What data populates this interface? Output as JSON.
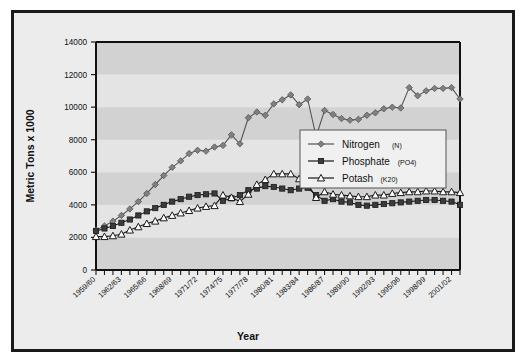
{
  "chart_data": {
    "type": "line",
    "title": "",
    "xlabel": "Year",
    "ylabel": "Metric Tons x 1000",
    "ylim": [
      0,
      14000
    ],
    "ytick_values": [
      0,
      2000,
      4000,
      6000,
      8000,
      10000,
      12000,
      14000
    ],
    "ytick_labels": [
      "0",
      "2000",
      "4000",
      "6000",
      "8000",
      "10000",
      "12000",
      "14000"
    ],
    "grid": "horizontal-bands",
    "legend_position": "inside-right-middle",
    "x": [
      "1959/60",
      "1960/61",
      "1961/62",
      "1962/63",
      "1963/64",
      "1964/65",
      "1965/66",
      "1966/67",
      "1967/68",
      "1968/69",
      "1969/70",
      "1970/71",
      "1971/72",
      "1972/73",
      "1973/74",
      "1974/75",
      "1975/76",
      "1976/77",
      "1977/78",
      "1978/79",
      "1979/80",
      "1980/81",
      "1981/82",
      "1982/83",
      "1983/84",
      "1984/85",
      "1985/86",
      "1986/87",
      "1987/88",
      "1988/89",
      "1989/90",
      "1990/91",
      "1991/92",
      "1992/93",
      "1993/94",
      "1994/95",
      "1995/96",
      "1996/97",
      "1997/98",
      "1998/99",
      "1999/00",
      "2000/01",
      "2001/02",
      "2002/03"
    ],
    "xtick_labels": [
      "1959/60",
      "1962/63",
      "1965/66",
      "1968/69",
      "1971/72",
      "1974/75",
      "1977/78",
      "1980/81",
      "1983/84",
      "1986/87",
      "1989/90",
      "1992/93",
      "1995/96",
      "1998/99",
      "2001/02"
    ],
    "xtick_label_interval": 3,
    "series": [
      {
        "name": "Nitrogen",
        "subscript": "(N)",
        "marker": "diamond",
        "color": "#808080",
        "line_color": "#555555",
        "values": [
          2450,
          2700,
          3000,
          3350,
          3750,
          4200,
          4700,
          5250,
          5800,
          6300,
          6700,
          7150,
          7350,
          7300,
          7550,
          7650,
          8300,
          7750,
          9350,
          9700,
          9500,
          10200,
          10450,
          10750,
          10150,
          10500,
          8200,
          9800,
          9550,
          9300,
          9200,
          9250,
          9500,
          9650,
          9900,
          10000,
          9950,
          11200,
          10700,
          11000,
          11150,
          11150,
          11200,
          10500
        ]
      },
      {
        "name": "Phosphate",
        "subscript": "(PO4)",
        "marker": "square",
        "color": "#3b3b3b",
        "line_color": "#1a1a1a",
        "values": [
          2400,
          2550,
          2700,
          2900,
          3100,
          3350,
          3600,
          3800,
          4000,
          4200,
          4350,
          4500,
          4600,
          4650,
          4700,
          4250,
          4400,
          4600,
          4900,
          5000,
          5150,
          5100,
          5000,
          4900,
          5000,
          5050,
          4600,
          4250,
          4350,
          4200,
          4150,
          4000,
          3950,
          4000,
          4050,
          4100,
          4150,
          4200,
          4250,
          4300,
          4300,
          4250,
          4200,
          4000
        ]
      },
      {
        "name": "Potash",
        "subscript": "(K20)",
        "marker": "triangle",
        "color": "#ffffff",
        "line_color": "#1a1a1a",
        "values": [
          2050,
          2050,
          2100,
          2200,
          2450,
          2650,
          2850,
          3000,
          3200,
          3350,
          3500,
          3650,
          3800,
          3900,
          3950,
          4600,
          4450,
          4200,
          4650,
          5250,
          5550,
          5900,
          5900,
          5900,
          5600,
          5300,
          4450,
          4800,
          4650,
          4600,
          4550,
          4500,
          4500,
          4600,
          4600,
          4700,
          4750,
          4800,
          4800,
          4850,
          4850,
          4800,
          4800,
          4750
        ]
      }
    ]
  },
  "legend": {
    "items": [
      {
        "label": "Nitrogen",
        "sub": "(N)"
      },
      {
        "label": "Phosphate",
        "sub": "(PO4)"
      },
      {
        "label": "Potash",
        "sub": "(K20)"
      }
    ]
  },
  "axes": {
    "y_title": "Metric Tons x 1000",
    "x_title": "Year"
  },
  "colors": {
    "frame_border": "#1a1a1a",
    "figure_bg": "#ececec",
    "page_bg": "#ffffff",
    "band_light": "#e4e4e4",
    "band_dark": "#d2d2d2",
    "nitrogen": "#808080",
    "phosphate": "#3b3b3b",
    "potash": "#ffffff"
  }
}
